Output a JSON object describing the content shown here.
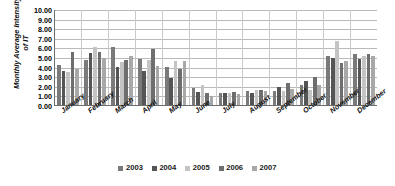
{
  "chart_data": {
    "type": "bar",
    "title": "",
    "xlabel": "",
    "ylabel": "Monthly Average Intensity\nof IT",
    "ylim": [
      0,
      10
    ],
    "ytick_labels": [
      "10.00",
      "9.00",
      "8.00",
      "7.00",
      "6.00",
      "5.00",
      "4.00",
      "3.00",
      "2.00",
      "1.00",
      "0.00"
    ],
    "ytick_values": [
      10,
      9,
      8,
      7,
      6,
      5,
      4,
      3,
      2,
      1,
      0
    ],
    "grid": true,
    "legend_position": "bottom",
    "categories": [
      "January",
      "February",
      "March",
      "April",
      "May",
      "June",
      "July",
      "August",
      "September",
      "October",
      "November",
      "December"
    ],
    "series": [
      {
        "name": "2003",
        "color": "#7a7a7a",
        "values": [
          4.2,
          4.65,
          6.05,
          4.75,
          3.95,
          1.75,
          1.25,
          1.5,
          1.45,
          2.1,
          5.1,
          5.35
        ]
      },
      {
        "name": "2004",
        "color": "#555555",
        "values": [
          3.5,
          5.4,
          4.0,
          3.55,
          2.85,
          1.35,
          1.2,
          1.3,
          1.85,
          2.45,
          4.85,
          4.75
        ]
      },
      {
        "name": "2005",
        "color": "#c4c4c4",
        "values": [
          3.4,
          6.05,
          4.5,
          4.65,
          4.55,
          2.1,
          1.2,
          1.6,
          1.45,
          1.6,
          6.7,
          5.1
        ]
      },
      {
        "name": "2006",
        "color": "#6e6e6e",
        "values": [
          5.5,
          5.5,
          4.65,
          5.8,
          3.8,
          1.3,
          1.35,
          1.55,
          2.3,
          2.95,
          4.4,
          5.3
        ]
      },
      {
        "name": "2007",
        "color": "#a8a8a8",
        "values": [
          3.7,
          4.9,
          5.15,
          4.05,
          4.55,
          0.95,
          1.15,
          1.5,
          1.7,
          2.05,
          4.6,
          5.15
        ]
      }
    ]
  },
  "legend": {
    "items": [
      {
        "label": "2003",
        "color": "#7a7a7a"
      },
      {
        "label": "2004",
        "color": "#555555"
      },
      {
        "label": "2005",
        "color": "#c4c4c4"
      },
      {
        "label": "2006",
        "color": "#6e6e6e"
      },
      {
        "label": "2007",
        "color": "#a8a8a8"
      }
    ]
  },
  "colors": {
    "axis": "#6d6d6d",
    "gridline": "#b9b9b9",
    "background": "#ffffff",
    "text": "#111111"
  }
}
